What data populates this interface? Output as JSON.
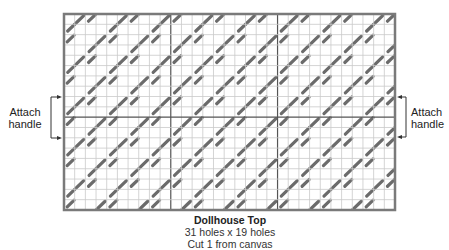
{
  "diagram": {
    "title": "Dollhouse Top",
    "dimensions": "31 holes x 19 holes",
    "cut_note": "Cut 1 from canvas",
    "grid": {
      "columns": 31,
      "rows": 19,
      "section_columns": [
        10,
        20
      ],
      "section_rows": [
        10
      ]
    },
    "left_annotation": {
      "line1": "Attach",
      "line2": "handle"
    },
    "right_annotation": {
      "line1": "Attach",
      "line2": "handle"
    },
    "colors": {
      "stitch": "#6b6b6b",
      "grid_line": "#c9c9c9",
      "border": "#7a7a7a",
      "divider": "#555555"
    }
  }
}
